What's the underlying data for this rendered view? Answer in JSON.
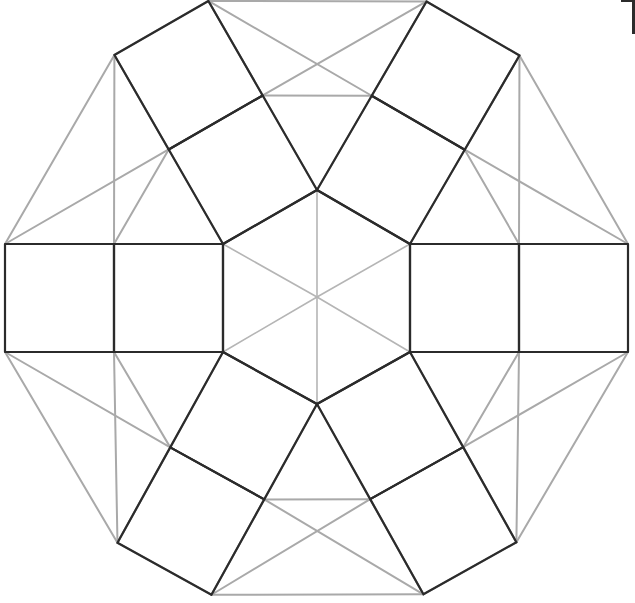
{
  "canvas": {
    "width": 635,
    "height": 603,
    "background": "#ffffff",
    "title": "Rosette tiling of squares, triangles and a central hexagon"
  },
  "style": {
    "lattice_color": "#a9a9a9",
    "lattice_stroke_width": 2.0,
    "overlay_color": "#2b2b2b",
    "overlay_stroke_width": 2.2,
    "hexagon_spoke_color": "#b5b5b5",
    "hexagon_spoke_width": 1.6,
    "corner_mark_color": "#2b2b2b"
  },
  "geometry": {
    "center": {
      "x": 317,
      "y": 297
    },
    "hexagon_circumradius": 107,
    "square_side": 109,
    "outer_ring_radius": 313,
    "rotation_step_degrees": 60,
    "description": "Regular hexagon at the centre; six pairs of squares radiate outward from the hexagon edges; a light grey triangular lattice fills the twelve-sided outer envelope."
  },
  "elements": {
    "center_hexagon": {
      "name": "center-hexagon",
      "vertices": [
        {
          "x": 317,
          "y": 190
        },
        {
          "x": 410,
          "y": 244
        },
        {
          "x": 410,
          "y": 352
        },
        {
          "x": 317,
          "y": 404
        },
        {
          "x": 223,
          "y": 352
        },
        {
          "x": 223,
          "y": 244
        }
      ],
      "spokes_from_center": 6
    },
    "square_pairs": [
      {
        "name": "square-pair-east",
        "angle_degrees": 0,
        "inner_square": {
          "x": 410,
          "y": 243,
          "w": 111,
          "h": 109,
          "rotation": 0
        },
        "outer_square": {
          "x": 521,
          "y": 243,
          "w": 110,
          "h": 109,
          "rotation": 0
        }
      },
      {
        "name": "square-pair-northeast",
        "angle_degrees": 300,
        "inner_square": {
          "rotation": -60
        },
        "outer_square": {
          "rotation": -60
        }
      },
      {
        "name": "square-pair-northwest",
        "angle_degrees": 240,
        "inner_square": {
          "rotation": -120
        },
        "outer_square": {
          "rotation": -120
        }
      },
      {
        "name": "square-pair-west",
        "angle_degrees": 180,
        "inner_square": {
          "x": 113,
          "y": 243,
          "w": 110,
          "h": 109,
          "rotation": 0
        },
        "outer_square": {
          "x": 4,
          "y": 243,
          "w": 109,
          "h": 109,
          "rotation": 0
        }
      },
      {
        "name": "square-pair-southwest",
        "angle_degrees": 120,
        "inner_square": {
          "rotation": -180
        },
        "outer_square": {
          "rotation": -180
        }
      },
      {
        "name": "square-pair-southeast",
        "angle_degrees": 60,
        "inner_square": {
          "rotation": -240
        },
        "outer_square": {
          "rotation": -240
        }
      }
    ],
    "lattice": {
      "name": "triangular-lattice",
      "outer_boundary_sides": 12,
      "triangle_count": 24,
      "note": "light grey equilateral-triangle grid filling the dodecagonal envelope behind the dark squares"
    },
    "corner_mark": {
      "name": "top-right-corner-mark",
      "visible": true,
      "position": "top-right"
    }
  },
  "labels": {
    "figure_caption": "",
    "annotations": []
  }
}
